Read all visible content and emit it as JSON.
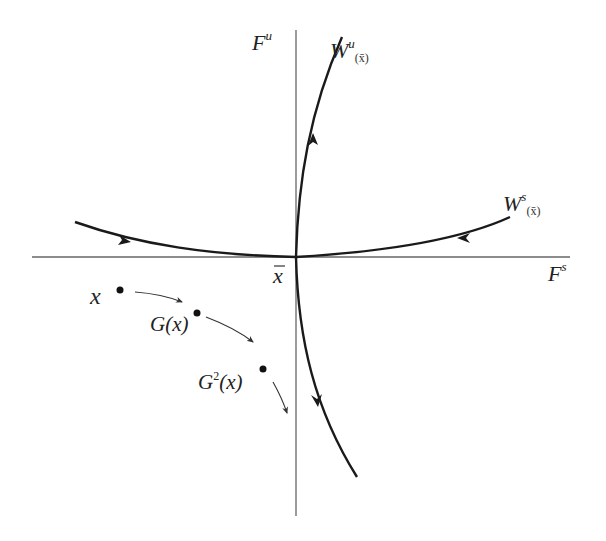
{
  "diagram": {
    "type": "phase-portrait",
    "colors": {
      "background": "#ffffff",
      "axis": "#555555",
      "manifold": "#1a1a1a",
      "orbit": "#333333"
    },
    "axes": {
      "vertical_label": {
        "base": "F",
        "sup": "u"
      },
      "horizontal_label": {
        "base": "F",
        "sup": "s"
      }
    },
    "fixed_point": {
      "label": "x",
      "bar": true
    },
    "manifolds": {
      "unstable": {
        "base": "W",
        "sup": "u",
        "sub": "(x̄)"
      },
      "stable": {
        "base": "W",
        "sup": "s",
        "sub": "(x̄)"
      }
    },
    "orbit": [
      {
        "label": "x"
      },
      {
        "label": "G(x)"
      },
      {
        "label_base": "G",
        "label_sup": "2",
        "label_rest": "(x)"
      }
    ]
  }
}
